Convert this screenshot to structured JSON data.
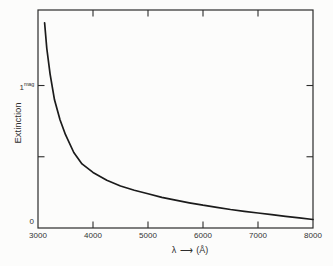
{
  "figure": {
    "ylabel": "Extinction",
    "xlabel": {
      "symbol": "λ",
      "arrow": "⟶",
      "unit": "(Å)"
    },
    "y_axis": {
      "one": "1",
      "one_sup": "mag",
      "zero": "0"
    }
  },
  "colors": {
    "ink": "#1b1b1b",
    "background": "#fcfcfb"
  },
  "chart_data": {
    "type": "line",
    "title": "",
    "xlabel": "λ ⟶ (Å)",
    "ylabel": "Extinction",
    "xlim": [
      3000,
      8000
    ],
    "ylim": [
      0,
      1.53
    ],
    "grid": false,
    "legend": null,
    "x_ticks": [
      4000,
      5000,
      6000,
      7000
    ],
    "x_tick_labels": [
      {
        "value": 3000,
        "label": "3000"
      },
      {
        "value": 4000,
        "label": "4000"
      },
      {
        "value": 5000,
        "label": "5000"
      },
      {
        "value": 6000,
        "label": "6000"
      },
      {
        "value": 7000,
        "label": "7000"
      },
      {
        "value": 8000,
        "label": "8000"
      }
    ],
    "y_ticks": [
      0.5,
      1.0
    ],
    "y_tick_labels": [
      {
        "value": 1.0,
        "label": "1mag"
      },
      {
        "value": 0,
        "label": "0"
      }
    ],
    "series": [
      {
        "name": "interstellar-extinction-curve",
        "x": [
          3120,
          3160,
          3220,
          3300,
          3400,
          3500,
          3650,
          3800,
          4000,
          4250,
          4500,
          4750,
          5000,
          5250,
          5500,
          5750,
          6000,
          6250,
          6500,
          6750,
          7000,
          7250,
          7500,
          7750,
          8000
        ],
        "y": [
          1.44,
          1.26,
          1.08,
          0.9,
          0.76,
          0.655,
          0.53,
          0.45,
          0.39,
          0.335,
          0.295,
          0.265,
          0.24,
          0.215,
          0.195,
          0.177,
          0.16,
          0.145,
          0.13,
          0.117,
          0.105,
          0.093,
          0.082,
          0.071,
          0.06
        ]
      }
    ]
  }
}
